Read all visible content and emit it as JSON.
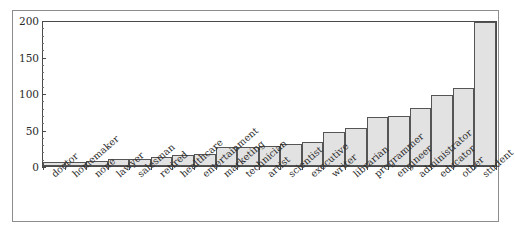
{
  "chart_data": {
    "type": "bar",
    "title": "",
    "subtitle": "",
    "xlabel": "",
    "ylabel": "",
    "ylim": [
      0,
      200
    ],
    "yticks": [
      0,
      50,
      100,
      150,
      200
    ],
    "ytick_labels": [
      "0",
      "50",
      "100",
      "150",
      "200"
    ],
    "grid": false,
    "legend": null,
    "bar_fill_color": "#e2e2e2",
    "bar_edge_color": "#555555",
    "axis_color": "#4a4a4a",
    "background_color": "#ffffff",
    "categories": [
      "doctor",
      "homemaker",
      "none",
      "lawyer",
      "salesman",
      "retired",
      "healthcare",
      "entertainment",
      "marketing",
      "technician",
      "artist",
      "scientist",
      "executive",
      "writer",
      "librarian",
      "programmer",
      "engineer",
      "administrator",
      "educator",
      "other",
      "student"
    ],
    "values": [
      5,
      5,
      7,
      10,
      10,
      12,
      15,
      17,
      26,
      27,
      28,
      31,
      33,
      47,
      53,
      68,
      69,
      81,
      98,
      108,
      200
    ]
  }
}
